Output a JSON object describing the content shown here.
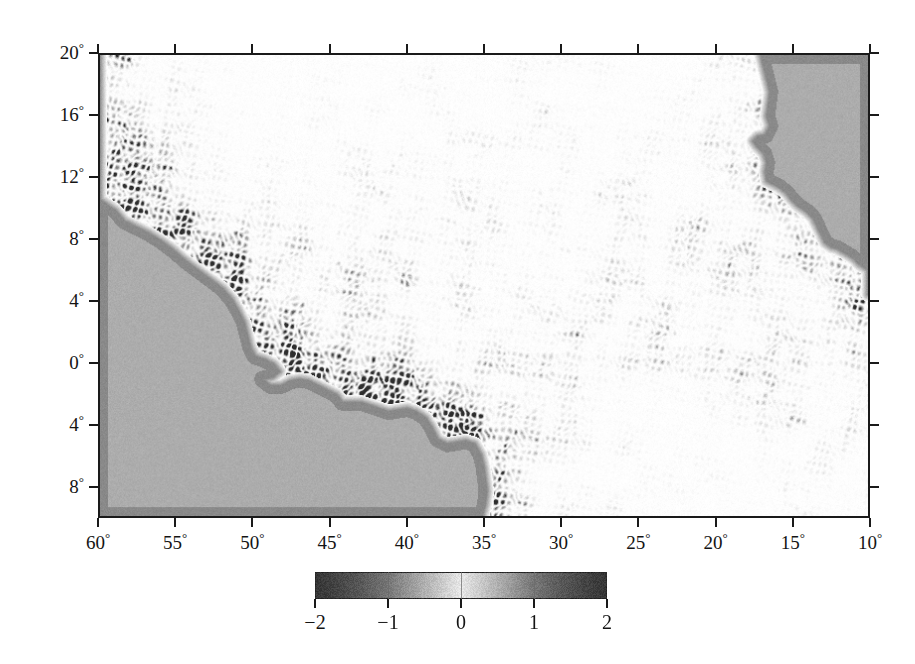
{
  "figure": {
    "kind": "geophysical-map",
    "background_color": "#ffffff",
    "frame_color": "#1a1a1a",
    "land_color": "#adadad",
    "shelf_color": "#8a8a8a",
    "ocean_base_color": "#ffffff"
  },
  "axes": {
    "x_label_suffix": "°",
    "y_label_suffix": "°",
    "x_ticks": [
      "60",
      "55",
      "50",
      "45",
      "40",
      "35",
      "30",
      "25",
      "20",
      "15",
      "10"
    ],
    "x_tick_values": [
      -60,
      -55,
      -50,
      -45,
      -40,
      -35,
      -30,
      -25,
      -20,
      -15,
      -10
    ],
    "y_ticks": [
      "20",
      "16",
      "12",
      "8",
      "4",
      "0",
      "4",
      "8"
    ],
    "y_tick_values": [
      20,
      16,
      12,
      8,
      4,
      0,
      -4,
      -8
    ],
    "xlim": [
      -60,
      -10
    ],
    "ylim": [
      -10,
      20
    ],
    "x_minor_present": false,
    "ticks_mirrored": true
  },
  "colorbar": {
    "orientation": "horizontal",
    "ticks": [
      "−2",
      "−1",
      "0",
      "1",
      "2"
    ],
    "tick_values": [
      -2,
      -1,
      0,
      1,
      2
    ],
    "vmin": -2,
    "vmax": 2,
    "colormap": "diverging-gray (dark / white / dark)",
    "stops": [
      "#2c2c2c",
      "#ababab",
      "#ffffff",
      "#ababab",
      "#2c2c2c"
    ]
  },
  "chart_data": {
    "type": "heatmap",
    "title": "",
    "subtitle": "",
    "xlabel": "",
    "ylabel": "",
    "xlim": [
      -60,
      -10
    ],
    "ylim": [
      -10,
      20
    ],
    "grid": false,
    "legend": "colorbar-below",
    "colorbar_label": "",
    "vmin": -2,
    "vmax": 2,
    "cmap": "gray-diverging",
    "xticks": [
      -60,
      -55,
      -50,
      -45,
      -40,
      -35,
      -30,
      -25,
      -20,
      -15,
      -10
    ],
    "xticklabels": [
      "60°",
      "55°",
      "50°",
      "45°",
      "40°",
      "35°",
      "30°",
      "25°",
      "20°",
      "15°",
      "10°"
    ],
    "yticks": [
      20,
      16,
      12,
      8,
      4,
      0,
      -4,
      -8
    ],
    "yticklabels": [
      "20°",
      "16°",
      "12°",
      "8°",
      "4°",
      "0°",
      "4°",
      "8°"
    ],
    "region": "Tropical Atlantic Ocean",
    "field_description": "Fine-scale banded wave-like anomaly field over ocean; masked continental areas rendered uniform gray",
    "masked_regions": [
      "South America (southwest)",
      "West Africa (east)"
    ],
    "features": [
      {
        "name": "coastal-wave-bands-brazil",
        "lon": -44,
        "lat": 2,
        "amplitude": -2.0
      },
      {
        "name": "coastal-wave-bands-northeast",
        "lon": -47,
        "lat": 9,
        "amplitude": -1.8
      },
      {
        "name": "open-ocean-speckle",
        "lon": -35,
        "lat": 10,
        "amplitude": 0.4
      },
      {
        "name": "guinea-coast-bands",
        "lon": -18,
        "lat": 8,
        "amplitude": -1.5
      },
      {
        "name": "north-band",
        "lon": -25,
        "lat": 17,
        "amplitude": -1.2
      }
    ]
  }
}
